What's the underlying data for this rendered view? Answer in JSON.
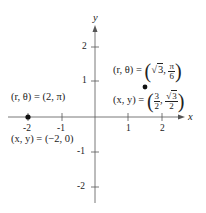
{
  "axes": {
    "x_label": "x",
    "y_label": "y",
    "x_ticks": [
      "-2",
      "-1",
      "1",
      "2"
    ],
    "y_ticks": [
      "2",
      "1",
      "-1",
      "-2"
    ]
  },
  "points": [
    {
      "polar_label": "(r, θ) = (2, π)",
      "rect_label": "(x, y) = (−2, 0)",
      "x": -2,
      "y": 0
    },
    {
      "polar_prefix": "(r, θ) =",
      "polar_r": "3",
      "polar_theta_num": "π",
      "polar_theta_den": "6",
      "rect_prefix": "(x, y) =",
      "rect_x_num": "3",
      "rect_x_den": "2",
      "rect_y_num": "3",
      "rect_y_den": "2",
      "x": 1.5,
      "y": 0.866
    }
  ],
  "colors": {
    "axis": "#555555",
    "point": "#111111",
    "text": "#222222"
  }
}
